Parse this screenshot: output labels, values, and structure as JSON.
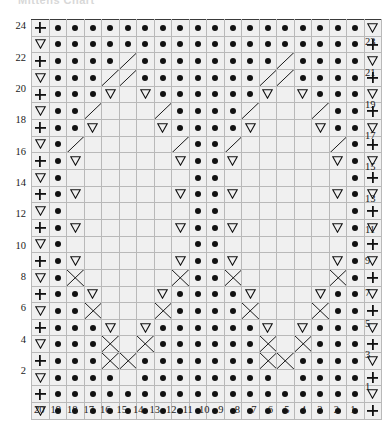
{
  "title": "Mittens Chart",
  "chart_data": {
    "type": "table",
    "xlabel": "Stitch number",
    "ylabel": "Row number",
    "grid": true,
    "columns": 20,
    "rows": 24,
    "column_labels": [
      "20",
      "19",
      "18",
      "17",
      "16",
      "15",
      "14",
      "13",
      "12",
      "11",
      "10",
      "9",
      "8",
      "7",
      "6",
      "5",
      "4",
      "3",
      "2",
      "1"
    ],
    "row_labels_left": [
      "24",
      "22",
      "20",
      "18",
      "16",
      "14",
      "12",
      "10",
      "8",
      "6",
      "4",
      "2"
    ],
    "row_labels_right": [
      "23",
      "21",
      "19",
      "17",
      "15",
      "13",
      "11",
      "9",
      "7",
      "5",
      "3",
      "1"
    ],
    "symbol_legend": {
      "dot": "purl stitch",
      "plus": "knit stitch / selvedge",
      "triangle-down": "decrease / cable marker",
      "gray-fill": "cable panel background",
      "white-fill": "reverse stocking ground"
    },
    "colors": {
      "ground_light": "#f0f0f0",
      "ground_white": "#ffffff",
      "cable_gray": "#9a9a9a",
      "grid_minor": "#b9b9b9",
      "grid_major": "#3a3a3a",
      "glyph": "#111111"
    },
    "cells": [
      [
        "P",
        "D",
        "D",
        "D",
        "D",
        "D",
        "D",
        "D",
        "D",
        "D",
        "D",
        "D",
        "D",
        "D",
        "D",
        "D",
        "D",
        "D",
        "D",
        "T"
      ],
      [
        "T",
        "D",
        "D",
        "D",
        "D",
        "D",
        "D",
        "D",
        "D",
        "D",
        "D",
        "D",
        "D",
        "D",
        "D",
        "D",
        "D",
        "D",
        "D",
        "P"
      ],
      [
        "P",
        "D",
        "D",
        "D",
        "D",
        "C",
        "D",
        "D",
        "D",
        "D",
        "D",
        "D",
        "D",
        "D",
        "C",
        "D",
        "D",
        "D",
        "D",
        "T"
      ],
      [
        "T",
        "D",
        "D",
        "D",
        "C",
        "C",
        "D",
        "D",
        "D",
        "D",
        "D",
        "D",
        "D",
        "C",
        "C",
        "D",
        "D",
        "D",
        "D",
        "P"
      ],
      [
        "P",
        "D",
        "D",
        "D",
        "T",
        "W",
        "T",
        "D",
        "D",
        "D",
        "D",
        "D",
        "D",
        "T",
        "W",
        "T",
        "D",
        "D",
        "D",
        "T"
      ],
      [
        "T",
        "D",
        "D",
        "C",
        "G",
        "W",
        "W",
        "C",
        "D",
        "D",
        "D",
        "D",
        "C",
        "G",
        "W",
        "W",
        "C",
        "D",
        "D",
        "P"
      ],
      [
        "P",
        "D",
        "D",
        "T",
        "W",
        "W",
        "W",
        "T",
        "D",
        "D",
        "D",
        "D",
        "T",
        "W",
        "W",
        "W",
        "T",
        "D",
        "D",
        "T"
      ],
      [
        "T",
        "D",
        "C",
        "G",
        "W",
        "W",
        "W",
        "W",
        "C",
        "D",
        "D",
        "C",
        "G",
        "W",
        "W",
        "W",
        "W",
        "C",
        "D",
        "P"
      ],
      [
        "P",
        "D",
        "T",
        "W",
        "W",
        "W",
        "W",
        "W",
        "T",
        "D",
        "D",
        "T",
        "W",
        "W",
        "W",
        "W",
        "W",
        "T",
        "D",
        "T"
      ],
      [
        "T",
        "D",
        "G",
        "G",
        "G",
        "G",
        "W",
        "G",
        "G",
        "D",
        "D",
        "G",
        "G",
        "G",
        "W",
        "G",
        "G",
        "G",
        "D",
        "P"
      ],
      [
        "P",
        "D",
        "T",
        "G",
        "G",
        "G",
        "G",
        "G",
        "T",
        "D",
        "D",
        "T",
        "G",
        "G",
        "W",
        "G",
        "G",
        "T",
        "D",
        "T"
      ],
      [
        "T",
        "D",
        "G",
        "W",
        "G",
        "G",
        "W",
        "G",
        "G",
        "D",
        "D",
        "G",
        "G",
        "W",
        "G",
        "W",
        "G",
        "G",
        "D",
        "P"
      ],
      [
        "P",
        "D",
        "T",
        "G",
        "G",
        "W",
        "G",
        "G",
        "T",
        "D",
        "D",
        "T",
        "G",
        "W",
        "G",
        "G",
        "G",
        "T",
        "D",
        "T"
      ],
      [
        "T",
        "D",
        "G",
        "G",
        "G",
        "G",
        "G",
        "G",
        "G",
        "D",
        "D",
        "G",
        "G",
        "G",
        "G",
        "G",
        "G",
        "G",
        "D",
        "P"
      ],
      [
        "P",
        "D",
        "T",
        "W",
        "W",
        "W",
        "W",
        "W",
        "T",
        "D",
        "D",
        "T",
        "W",
        "W",
        "W",
        "W",
        "W",
        "T",
        "D",
        "T"
      ],
      [
        "T",
        "D",
        "X",
        "G",
        "W",
        "W",
        "W",
        "G",
        "X",
        "D",
        "D",
        "X",
        "G",
        "W",
        "W",
        "W",
        "G",
        "X",
        "D",
        "P"
      ],
      [
        "P",
        "D",
        "D",
        "T",
        "W",
        "W",
        "W",
        "T",
        "D",
        "D",
        "D",
        "D",
        "T",
        "W",
        "W",
        "W",
        "T",
        "D",
        "D",
        "T"
      ],
      [
        "T",
        "D",
        "D",
        "X",
        "G",
        "W",
        "G",
        "X",
        "D",
        "D",
        "D",
        "D",
        "X",
        "G",
        "W",
        "G",
        "X",
        "D",
        "D",
        "P"
      ],
      [
        "P",
        "D",
        "D",
        "D",
        "T",
        "W",
        "T",
        "D",
        "D",
        "D",
        "D",
        "D",
        "D",
        "T",
        "W",
        "T",
        "D",
        "D",
        "D",
        "T"
      ],
      [
        "T",
        "D",
        "D",
        "D",
        "X",
        "G",
        "X",
        "D",
        "D",
        "D",
        "D",
        "D",
        "D",
        "X",
        "G",
        "X",
        "D",
        "D",
        "D",
        "P"
      ],
      [
        "P",
        "D",
        "D",
        "D",
        "X",
        "X",
        "D",
        "D",
        "D",
        "D",
        "D",
        "D",
        "D",
        "X",
        "X",
        "D",
        "D",
        "D",
        "D",
        "T"
      ],
      [
        "T",
        "D",
        "D",
        "D",
        "D",
        "G",
        "D",
        "D",
        "D",
        "D",
        "D",
        "D",
        "D",
        "D",
        "G",
        "D",
        "D",
        "D",
        "D",
        "P"
      ],
      [
        "P",
        "D",
        "D",
        "D",
        "D",
        "D",
        "D",
        "D",
        "D",
        "D",
        "D",
        "D",
        "D",
        "D",
        "D",
        "D",
        "D",
        "D",
        "D",
        "T"
      ],
      [
        "T",
        "D",
        "D",
        "D",
        "D",
        "D",
        "D",
        "D",
        "D",
        "D",
        "D",
        "D",
        "D",
        "D",
        "D",
        "D",
        "D",
        "D",
        "D",
        "P"
      ]
    ],
    "cell_code_meaning": {
      "P": "light cell with plus glyph",
      "T": "light cell with down-triangle glyph",
      "D": "light cell with filled dot",
      "W": "white empty cell",
      "G": "gray filled cell",
      "C": "light cell with diagonal cable line",
      "X": "gray cell with crossing cable line"
    }
  }
}
